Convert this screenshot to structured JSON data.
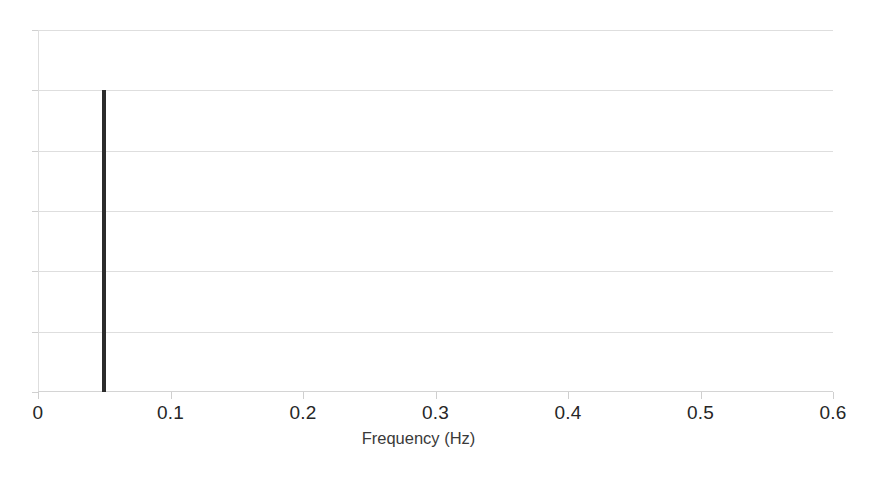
{
  "figure": {
    "background_color": "#ffffff",
    "axis_color": "#dedede",
    "grid_color": "#dedede",
    "series_color": "#2c2c2c",
    "tick_label_color": "#262626"
  },
  "chart_data": {
    "type": "bar",
    "title": "",
    "subtitle": "",
    "xlabel": "Frequency (Hz)",
    "ylabel": "",
    "xlim": [
      0,
      0.6
    ],
    "ylim": [
      0,
      6
    ],
    "xticks": [
      0,
      0.1,
      0.2,
      0.3,
      0.4,
      0.5,
      0.6
    ],
    "xticklabels": [
      "0",
      "0.1",
      "0.2",
      "0.3",
      "0.4",
      "0.5",
      "0.6"
    ],
    "yticks": [
      0,
      1,
      2,
      3,
      4,
      5,
      6
    ],
    "yticklabels": [
      "",
      "",
      "",
      "",
      "",
      "",
      ""
    ],
    "grid": "horizontal",
    "legend": "none",
    "annotations": [],
    "series": [
      {
        "name": "spectrum",
        "color": "#2c2c2c",
        "x": [
          0.05
        ],
        "values": [
          5.0
        ],
        "bar_width": 0.003
      }
    ],
    "points": [
      {
        "label": "peak",
        "x": 0.05,
        "y": 5.0
      }
    ]
  }
}
